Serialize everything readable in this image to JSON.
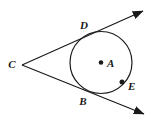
{
  "figure": {
    "background_color": "#ffffff",
    "stroke_color": "#1a1a1a",
    "width": 156,
    "height": 122
  },
  "circle": {
    "name": "circle-A",
    "center_x": 101,
    "center_y": 62.5,
    "radius": 31,
    "stroke_color": "#1a1a1a",
    "stroke_width": 1.2,
    "fill": "none"
  },
  "points": [
    {
      "id": "C",
      "label": "C",
      "x": 22,
      "y": 65,
      "label_x": 12,
      "label_y": 68,
      "dot": false,
      "role": "external-vertex"
    },
    {
      "id": "D",
      "label": "D",
      "x": 86,
      "y": 35,
      "label_x": 84,
      "label_y": 29,
      "dot": false,
      "role": "tangent-point-upper"
    },
    {
      "id": "B",
      "label": "B",
      "x": 84,
      "y": 89,
      "label_x": 83,
      "label_y": 105,
      "dot": false,
      "role": "tangent-point-lower"
    },
    {
      "id": "A",
      "label": "A",
      "x": 101,
      "y": 62.5,
      "label_x": 107,
      "label_y": 67,
      "dot": true,
      "role": "center"
    },
    {
      "id": "E",
      "label": "E",
      "x": 122,
      "y": 82,
      "label_x": 128,
      "label_y": 90,
      "dot": true,
      "role": "point-on-circle"
    }
  ],
  "rays": [
    {
      "id": "ray-CD",
      "label": "ray C through D",
      "start_x": 22,
      "start_y": 65,
      "end_x": 143,
      "end_y": 11,
      "arrow_at_end": true
    },
    {
      "id": "ray-CB",
      "label": "ray C through B",
      "start_x": 22,
      "start_y": 65,
      "end_x": 144,
      "end_y": 114,
      "arrow_at_end": true
    }
  ],
  "dot_radius": 2.3,
  "arrow": {
    "length": 11,
    "width": 7
  }
}
